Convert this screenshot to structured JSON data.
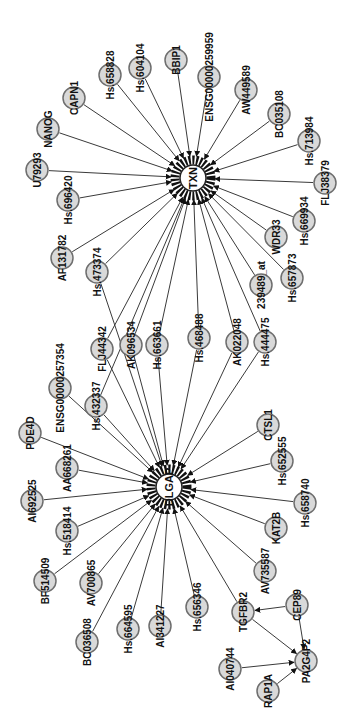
{
  "diagram": {
    "type": "gene-interaction-network",
    "orientation": "rotated-90-ccw",
    "colors": {
      "node_fill": "#d9d9d9",
      "node_stroke": "#6e6e6e",
      "edge": "#3a3a3a",
      "label": "#111111",
      "background": "#ffffff"
    },
    "hubs": [
      {
        "id": "TXN",
        "label": "TXN",
        "x": 193,
        "y": 178
      },
      {
        "id": "DLGAP",
        "label": "DLGAP",
        "x": 169,
        "y": 487
      }
    ],
    "nodes": [
      {
        "id": "Hs658828",
        "label": "Hs.658828",
        "x": 110,
        "y": 75
      },
      {
        "id": "Hs604104",
        "label": "Hs.604104",
        "x": 140,
        "y": 68
      },
      {
        "id": "BBIP1",
        "label": "BBIP1",
        "x": 176,
        "y": 60
      },
      {
        "id": "ENSG00000259959",
        "label": "ENSG00000259959",
        "x": 209,
        "y": 77
      },
      {
        "id": "AW449589",
        "label": "AW449589",
        "x": 246,
        "y": 90
      },
      {
        "id": "BC035108",
        "label": "BC035108",
        "x": 279,
        "y": 114
      },
      {
        "id": "Hs713984",
        "label": "Hs.713984",
        "x": 309,
        "y": 141
      },
      {
        "id": "CAPN1",
        "label": "CAPN1",
        "x": 74,
        "y": 98
      },
      {
        "id": "NANOG",
        "label": "NANOG",
        "x": 48,
        "y": 129
      },
      {
        "id": "U79293",
        "label": "U79293",
        "x": 37,
        "y": 170
      },
      {
        "id": "Hs696420",
        "label": "Hs.696420",
        "x": 68,
        "y": 200
      },
      {
        "id": "FLJ38379",
        "label": "FLJ38379",
        "x": 325,
        "y": 183
      },
      {
        "id": "Hs669934",
        "label": "Hs.669934",
        "x": 304,
        "y": 221
      },
      {
        "id": "WDR33",
        "label": "WDR33",
        "x": 276,
        "y": 237
      },
      {
        "id": "AF131782",
        "label": "AF131782",
        "x": 62,
        "y": 258
      },
      {
        "id": "Hs473374",
        "label": "Hs.473374",
        "x": 97,
        "y": 272
      },
      {
        "id": "Hs657873",
        "label": "Hs.657873",
        "x": 292,
        "y": 278
      },
      {
        "id": "239489_at",
        "label": "239489_at",
        "x": 261,
        "y": 285
      },
      {
        "id": "FLJ44342",
        "label": "FLJ44342",
        "x": 102,
        "y": 349
      },
      {
        "id": "AK096534",
        "label": "AK096534",
        "x": 131,
        "y": 345
      },
      {
        "id": "Hs663661",
        "label": "Hs.663661",
        "x": 157,
        "y": 345
      },
      {
        "id": "Hs468488",
        "label": "Hs.468488",
        "x": 199,
        "y": 338
      },
      {
        "id": "AK022048",
        "label": "AK022048",
        "x": 237,
        "y": 342
      },
      {
        "id": "Hs444475",
        "label": "Hs.444475",
        "x": 265,
        "y": 342
      },
      {
        "id": "ENSG00000257354",
        "label": "ENSG00000257354",
        "x": 60,
        "y": 388
      },
      {
        "id": "Hs432337",
        "label": "Hs.432337",
        "x": 96,
        "y": 406
      },
      {
        "id": "PDE4D",
        "label": "PDE4D",
        "x": 30,
        "y": 433
      },
      {
        "id": "AA668261",
        "label": "AA668261",
        "x": 67,
        "y": 468
      },
      {
        "id": "AI692525",
        "label": "AI692525",
        "x": 32,
        "y": 501
      },
      {
        "id": "Hs518414",
        "label": "Hs.518414",
        "x": 67,
        "y": 531
      },
      {
        "id": "CTSL1",
        "label": "CTSL1",
        "x": 268,
        "y": 425
      },
      {
        "id": "Hs652555",
        "label": "Hs.652555",
        "x": 282,
        "y": 461
      },
      {
        "id": "Hs658740",
        "label": "Hs.658740",
        "x": 305,
        "y": 503
      },
      {
        "id": "KAT2B",
        "label": "KAT2B",
        "x": 276,
        "y": 528
      },
      {
        "id": "BF514509",
        "label": "BF514509",
        "x": 45,
        "y": 581
      },
      {
        "id": "AV700865",
        "label": "AV700865",
        "x": 91,
        "y": 583
      },
      {
        "id": "AV735587",
        "label": "AV735587",
        "x": 265,
        "y": 571
      },
      {
        "id": "Hs656346",
        "label": "Hs.656346",
        "x": 197,
        "y": 607
      },
      {
        "id": "BC036508",
        "label": "BC036508",
        "x": 87,
        "y": 642
      },
      {
        "id": "Hs664595",
        "label": "Hs.664595",
        "x": 128,
        "y": 629
      },
      {
        "id": "AI341227",
        "label": "AI341227",
        "x": 160,
        "y": 626
      },
      {
        "id": "TGFBR2",
        "label": "TGFBR2",
        "x": 243,
        "y": 612
      },
      {
        "id": "CEP89",
        "label": "CEP89",
        "x": 297,
        "y": 605
      },
      {
        "id": "AI040744",
        "label": "AI040744",
        "x": 230,
        "y": 669
      },
      {
        "id": "PA2G4P2",
        "label": "PA2G4P2",
        "x": 306,
        "y": 661
      },
      {
        "id": "RAP1A",
        "label": "RAP1A",
        "x": 268,
        "y": 691
      }
    ],
    "edges": [
      {
        "from": "Hs658828",
        "to": "TXN"
      },
      {
        "from": "Hs604104",
        "to": "TXN"
      },
      {
        "from": "BBIP1",
        "to": "TXN"
      },
      {
        "from": "ENSG00000259959",
        "to": "TXN"
      },
      {
        "from": "AW449589",
        "to": "TXN"
      },
      {
        "from": "BC035108",
        "to": "TXN"
      },
      {
        "from": "Hs713984",
        "to": "TXN"
      },
      {
        "from": "CAPN1",
        "to": "TXN"
      },
      {
        "from": "NANOG",
        "to": "TXN"
      },
      {
        "from": "U79293",
        "to": "TXN"
      },
      {
        "from": "Hs696420",
        "to": "TXN"
      },
      {
        "from": "FLJ38379",
        "to": "TXN"
      },
      {
        "from": "Hs669934",
        "to": "TXN"
      },
      {
        "from": "WDR33",
        "to": "TXN"
      },
      {
        "from": "AF131782",
        "to": "TXN"
      },
      {
        "from": "Hs473374",
        "to": "TXN"
      },
      {
        "from": "Hs657873",
        "to": "TXN"
      },
      {
        "from": "239489_at",
        "to": "TXN"
      },
      {
        "from": "FLJ44342",
        "to": "TXN"
      },
      {
        "from": "AK096534",
        "to": "TXN"
      },
      {
        "from": "Hs663661",
        "to": "TXN"
      },
      {
        "from": "Hs468488",
        "to": "TXN"
      },
      {
        "from": "AK022048",
        "to": "TXN"
      },
      {
        "from": "Hs444475",
        "to": "TXN"
      },
      {
        "from": "Hs432337",
        "to": "TXN"
      },
      {
        "from": "FLJ44342",
        "to": "DLGAP"
      },
      {
        "from": "AK096534",
        "to": "DLGAP"
      },
      {
        "from": "Hs663661",
        "to": "DLGAP"
      },
      {
        "from": "Hs468488",
        "to": "DLGAP"
      },
      {
        "from": "AK022048",
        "to": "DLGAP"
      },
      {
        "from": "Hs444475",
        "to": "DLGAP"
      },
      {
        "from": "Hs473374",
        "to": "DLGAP"
      },
      {
        "from": "ENSG00000257354",
        "to": "DLGAP"
      },
      {
        "from": "Hs432337",
        "to": "DLGAP"
      },
      {
        "from": "PDE4D",
        "to": "DLGAP"
      },
      {
        "from": "AA668261",
        "to": "DLGAP"
      },
      {
        "from": "AI692525",
        "to": "DLGAP"
      },
      {
        "from": "Hs518414",
        "to": "DLGAP"
      },
      {
        "from": "CTSL1",
        "to": "DLGAP"
      },
      {
        "from": "Hs652555",
        "to": "DLGAP"
      },
      {
        "from": "Hs658740",
        "to": "DLGAP"
      },
      {
        "from": "KAT2B",
        "to": "DLGAP"
      },
      {
        "from": "BF514509",
        "to": "DLGAP"
      },
      {
        "from": "AV700865",
        "to": "DLGAP"
      },
      {
        "from": "AV735587",
        "to": "DLGAP"
      },
      {
        "from": "Hs656346",
        "to": "DLGAP"
      },
      {
        "from": "BC036508",
        "to": "DLGAP"
      },
      {
        "from": "Hs664595",
        "to": "DLGAP"
      },
      {
        "from": "AI341227",
        "to": "DLGAP"
      },
      {
        "from": "TGFBR2",
        "to": "DLGAP"
      },
      {
        "from": "CEP89",
        "to": "TGFBR2"
      },
      {
        "from": "TGFBR2",
        "to": "PA2G4P2"
      },
      {
        "from": "CEP89",
        "to": "PA2G4P2"
      },
      {
        "from": "AI040744",
        "to": "PA2G4P2"
      },
      {
        "from": "RAP1A",
        "to": "PA2G4P2"
      }
    ]
  }
}
